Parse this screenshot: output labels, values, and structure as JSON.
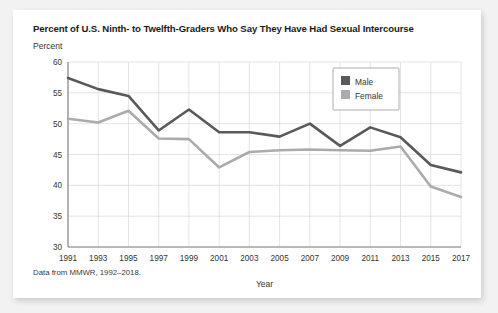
{
  "card": {
    "title": "Percent of U.S. Ninth- to Twelfth-Graders Who Say They Have Had Sexual Intercourse",
    "source_note": "Data from MMWR, 1992–2018."
  },
  "chart_data": {
    "type": "line",
    "title": "Percent of U.S. Ninth- to Twelfth-Graders Who Say They Have Had Sexual Intercourse",
    "xlabel": "Year",
    "ylabel": "Percent",
    "ylim": [
      30,
      60
    ],
    "yticks": [
      30,
      35,
      40,
      45,
      50,
      55,
      60
    ],
    "grid": true,
    "legend_position": "top-right",
    "categories": [
      1991,
      1993,
      1995,
      1997,
      1999,
      2001,
      2003,
      2005,
      2007,
      2009,
      2011,
      2013,
      2015,
      2017
    ],
    "x": [
      "1991",
      "1993",
      "1995",
      "1997",
      "1999",
      "2001",
      "2003",
      "2005",
      "2007",
      "2009",
      "2011",
      "2013",
      "2015",
      "2017"
    ],
    "series": [
      {
        "name": "Male",
        "color": "#58595b",
        "values": [
          57.4,
          55.6,
          54.5,
          48.9,
          52.3,
          48.6,
          48.6,
          47.9,
          50.0,
          46.4,
          49.4,
          47.8,
          43.3,
          42.1
        ]
      },
      {
        "name": "Female",
        "color": "#a9abae",
        "values": [
          50.8,
          50.2,
          52.1,
          47.6,
          47.5,
          42.9,
          45.4,
          45.7,
          45.8,
          45.7,
          45.6,
          46.3,
          39.8,
          38.1
        ]
      }
    ]
  },
  "legend": {
    "items": [
      {
        "label": "Male",
        "color": "#58595b"
      },
      {
        "label": "Female",
        "color": "#a9abae"
      }
    ]
  },
  "axes": {
    "y_tick_labels": [
      "60",
      "55",
      "50",
      "45",
      "40",
      "35",
      "30"
    ],
    "x_tick_labels": [
      "1991",
      "1993",
      "1995",
      "1997",
      "1999",
      "2001",
      "2003",
      "2005",
      "2007",
      "2009",
      "2011",
      "2013",
      "2015",
      "2017"
    ],
    "x_axis_title": "Year",
    "y_axis_title": "Percent"
  }
}
